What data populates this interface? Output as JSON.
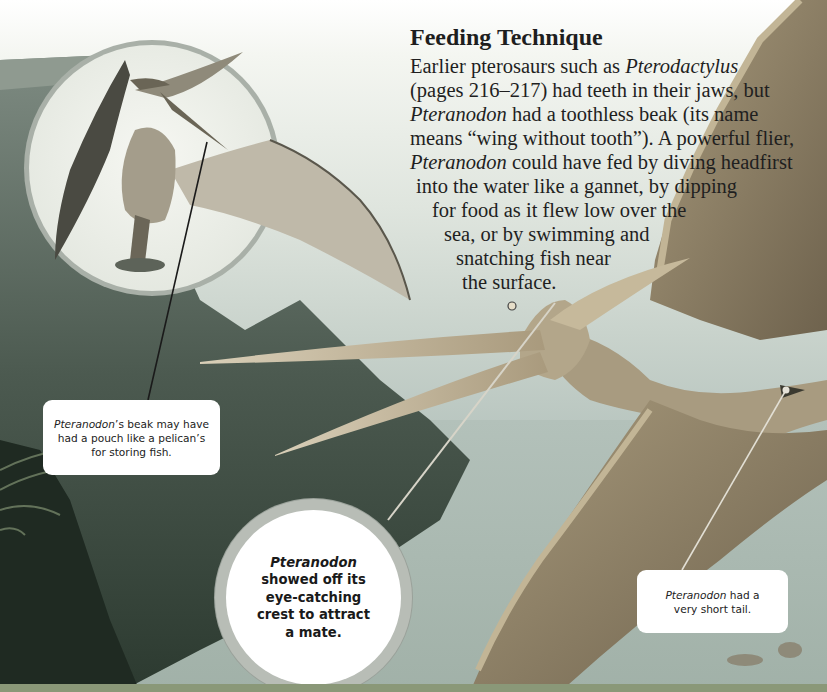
{
  "page": {
    "top_cropped_text": "",
    "heading": "Feeding Technique",
    "body_lines": [
      {
        "parts": [
          {
            "t": "Earlier pterosaurs such as ",
            "i": false
          },
          {
            "t": "Pterodactylus",
            "i": true
          }
        ]
      },
      {
        "parts": [
          {
            "t": "(pages 216–217) had teeth in their jaws, but",
            "i": false
          }
        ]
      },
      {
        "parts": [
          {
            "t": "Pteranodon",
            "i": true
          },
          {
            "t": " had a toothless beak (its name",
            "i": false
          }
        ]
      },
      {
        "parts": [
          {
            "t": "means “wing without tooth”). A powerful flier,",
            "i": false
          }
        ]
      },
      {
        "parts": [
          {
            "t": "Pteranodon",
            "i": true
          },
          {
            "t": " could have fed by diving headfirst",
            "i": false
          }
        ]
      },
      {
        "parts": [
          {
            "t": "into the water like a gannet, by dipping",
            "i": false
          }
        ]
      },
      {
        "parts": [
          {
            "t": "for food as it flew low over the",
            "i": false
          }
        ]
      },
      {
        "parts": [
          {
            "t": "sea, or by swimming and",
            "i": false
          }
        ]
      },
      {
        "parts": [
          {
            "t": "snatching fish near",
            "i": false
          }
        ]
      },
      {
        "parts": [
          {
            "t": "the surface.",
            "i": false
          }
        ]
      }
    ]
  },
  "callouts": {
    "beak_pouch": {
      "italic": "Pteranodon",
      "rest": "’s beak may have had a pouch like a pelican’s for storing fish."
    },
    "crest": {
      "italic": "Pteranodon",
      "rest": " showed off its eye-catching crest to attract a mate."
    },
    "tail": {
      "italic": "Pteranodon",
      "rest": " had a very short tail."
    }
  },
  "colors": {
    "sky_top": "#ffffff",
    "sky_bottom": "#9aaba3",
    "cliff": "#4d5a4f",
    "pterosaur_body": "#b9ab8c",
    "pterosaur_wing": "#8c7f66",
    "footer_band": "#8a9878",
    "callout_bg": "#ffffff",
    "bubble_ring": "#b8bdb6"
  },
  "icons": {
    "inset_circle": "pterosaur-standing-illustration",
    "main_art": "pterosaur-flying-illustration",
    "fern": "fern-foliage-illustration"
  }
}
